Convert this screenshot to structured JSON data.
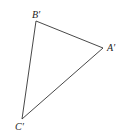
{
  "diagram": {
    "type": "triangle",
    "stroke_color": "#333333",
    "background": "#ffffff",
    "vertices": [
      {
        "name": "B",
        "label": "B′",
        "x": 36,
        "y": 21,
        "label_x": 32,
        "label_y": 10
      },
      {
        "name": "A",
        "label": "A′",
        "x": 103,
        "y": 48,
        "label_x": 107,
        "label_y": 43
      },
      {
        "name": "C",
        "label": "C′",
        "x": 22,
        "y": 119,
        "label_x": 15,
        "label_y": 122
      }
    ]
  }
}
